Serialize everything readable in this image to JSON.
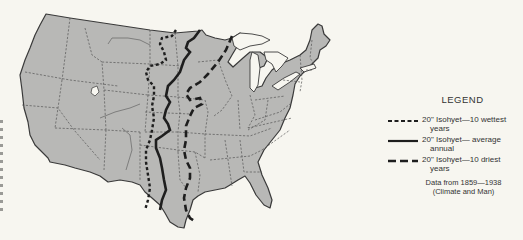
{
  "map": {
    "subject": "Contiguous United States with 20-inch isohyet lines",
    "colors": {
      "background": "#f7f6f0",
      "land": "#b8b8b6",
      "outline": "#3a3a3a",
      "state_border": "#555555",
      "isohyet": "#1e1e1e"
    },
    "isohyets": [
      {
        "id": "wettest",
        "style": "short-dash",
        "label": "20\" Isohyet—10 wettest years"
      },
      {
        "id": "average",
        "style": "solid",
        "label": "20\" Isohyet—average annual"
      },
      {
        "id": "driest",
        "style": "long-dash",
        "label": "20\" Isohyet—10 driest years"
      }
    ]
  },
  "legend": {
    "title": "LEGEND",
    "items": [
      {
        "style": "short-dash",
        "line1": "20\" Isohyet—10 wettest",
        "line2": "years"
      },
      {
        "style": "solid",
        "line1": "20\" Isohyet— average",
        "line2": "annual"
      },
      {
        "style": "long-dash",
        "line1": "20\" Isohyet—10 driest",
        "line2": "years"
      }
    ],
    "source_line1": "Data from 1859—1938",
    "source_line2": "(Climate and Man)"
  }
}
